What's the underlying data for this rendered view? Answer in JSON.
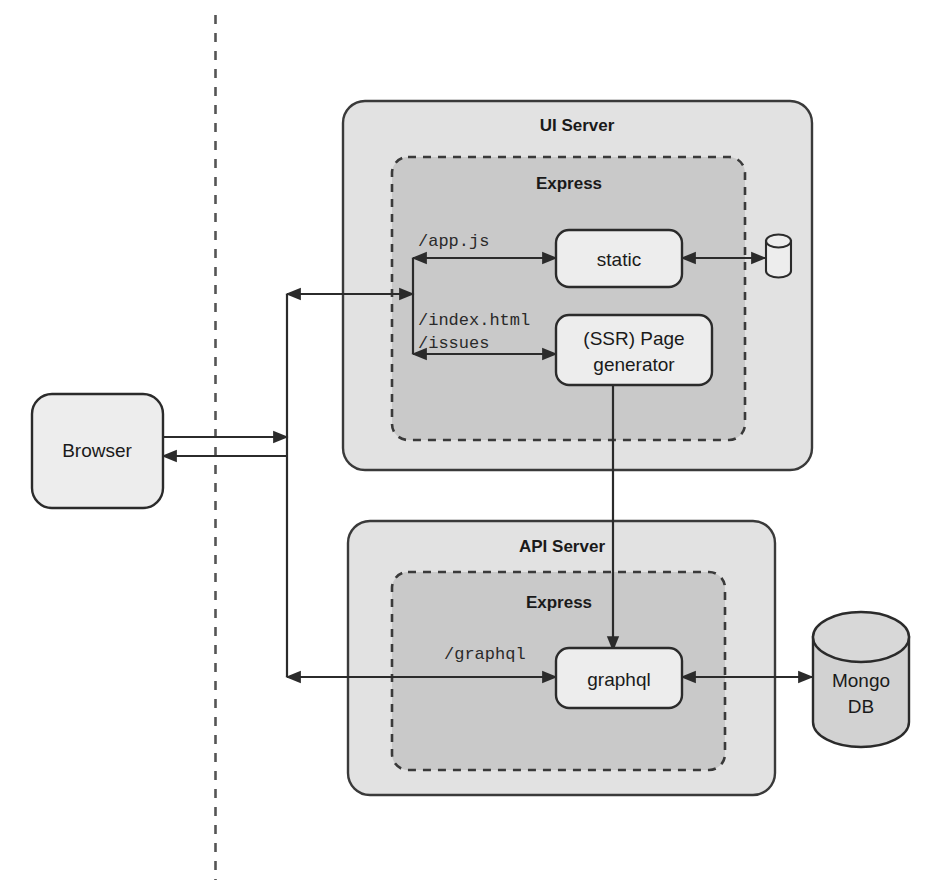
{
  "diagram": {
    "colors": {
      "outer_fill": "#e2e2e2",
      "inner_fill": "#c9c9c9",
      "node_fill": "#ededed",
      "stroke": "#3a3a3a",
      "text": "#1a1a1a",
      "background": "#ffffff"
    },
    "divider": {
      "name": "client-server-divider",
      "style": "dashed-vertical"
    },
    "containers": [
      {
        "id": "ui-server",
        "label": "UI Server"
      },
      {
        "id": "api-server",
        "label": "API Server"
      }
    ],
    "inner_containers": [
      {
        "id": "ui-express",
        "label": "Express"
      },
      {
        "id": "api-express",
        "label": "Express"
      }
    ],
    "nodes": [
      {
        "id": "browser",
        "label": "Browser"
      },
      {
        "id": "static",
        "label": "static"
      },
      {
        "id": "ssr-page-generator",
        "label_line1": "(SSR) Page",
        "label_line2": "generator"
      },
      {
        "id": "graphql",
        "label": "graphql"
      },
      {
        "id": "file-store",
        "label": ""
      },
      {
        "id": "mongo-db",
        "label_line1": "Mongo",
        "label_line2": "DB"
      }
    ],
    "route_labels": [
      {
        "id": "route-app-js",
        "text": "/app.js"
      },
      {
        "id": "route-index-html",
        "text": "/index.html"
      },
      {
        "id": "route-issues",
        "text": "/issues"
      },
      {
        "id": "route-graphql",
        "text": "/graphql"
      }
    ],
    "edges": [
      {
        "id": "browser-to-trunk",
        "from": "browser",
        "to": "trunk",
        "direction": "right"
      },
      {
        "id": "trunk-to-browser",
        "from": "trunk",
        "to": "browser",
        "direction": "left"
      },
      {
        "id": "trunk-to-ui-express",
        "from": "trunk",
        "to": "ui-express-router",
        "direction": "both"
      },
      {
        "id": "router-to-static",
        "from": "ui-express-router",
        "to": "static",
        "direction": "both"
      },
      {
        "id": "router-to-ssr",
        "from": "ui-express-router",
        "to": "ssr-page-generator",
        "direction": "both"
      },
      {
        "id": "static-to-file-store",
        "from": "static",
        "to": "file-store",
        "direction": "both"
      },
      {
        "id": "ssr-to-graphql",
        "from": "ssr-page-generator",
        "to": "graphql",
        "direction": "down"
      },
      {
        "id": "trunk-to-api-graphql",
        "from": "trunk",
        "to": "graphql",
        "direction": "both"
      },
      {
        "id": "graphql-to-mongo",
        "from": "graphql",
        "to": "mongo-db",
        "direction": "both"
      }
    ]
  }
}
